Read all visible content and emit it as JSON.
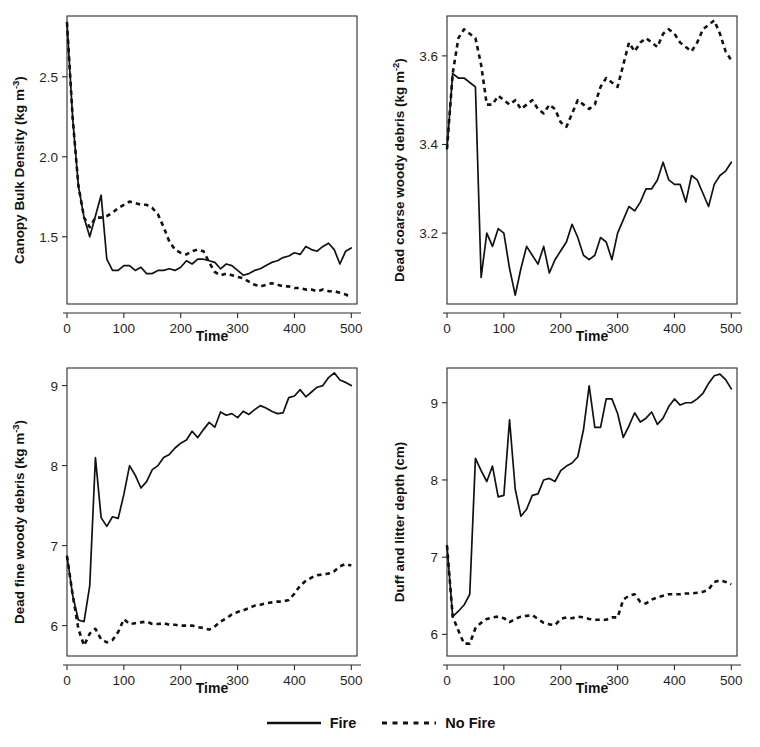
{
  "figure": {
    "layout": "2x2 grid of line charts with shared bottom legend",
    "legend": {
      "position": "bottom-center",
      "entries": [
        {
          "label": "Fire",
          "style": "solid",
          "color": "#111111"
        },
        {
          "label": "No Fire",
          "style": "dashed",
          "color": "#111111"
        }
      ]
    }
  },
  "chart_data": [
    {
      "type": "line",
      "panel": "top-left",
      "title": "",
      "xlabel": "Time",
      "ylabel": "Canopy Bulk Density (kg m-3)",
      "ylabel_base": "Canopy Bulk Density (kg m",
      "ylabel_sup": "-3",
      "ylabel_tail": ")",
      "xlim": [
        0,
        510
      ],
      "ylim": [
        1.08,
        2.88
      ],
      "xticks": [
        0,
        100,
        200,
        300,
        400,
        500
      ],
      "yticks": [
        1.5,
        2.0,
        2.5
      ],
      "ytick_labels": [
        "1.5",
        "2.0",
        "2.5"
      ],
      "grid": false,
      "x": [
        0,
        10,
        20,
        30,
        40,
        50,
        60,
        70,
        80,
        90,
        100,
        110,
        120,
        130,
        140,
        150,
        160,
        170,
        180,
        190,
        200,
        210,
        220,
        230,
        240,
        250,
        260,
        270,
        280,
        290,
        300,
        310,
        320,
        330,
        340,
        350,
        360,
        370,
        380,
        390,
        400,
        410,
        420,
        430,
        440,
        450,
        460,
        470,
        480,
        490,
        500
      ],
      "series": [
        {
          "name": "Fire",
          "style": "solid",
          "values": [
            2.84,
            2.24,
            1.82,
            1.62,
            1.5,
            1.63,
            1.76,
            1.36,
            1.29,
            1.29,
            1.32,
            1.32,
            1.29,
            1.31,
            1.27,
            1.27,
            1.29,
            1.29,
            1.3,
            1.29,
            1.31,
            1.35,
            1.33,
            1.36,
            1.36,
            1.35,
            1.34,
            1.3,
            1.33,
            1.32,
            1.29,
            1.26,
            1.27,
            1.29,
            1.3,
            1.32,
            1.34,
            1.35,
            1.37,
            1.38,
            1.4,
            1.39,
            1.44,
            1.42,
            1.41,
            1.44,
            1.46,
            1.42,
            1.33,
            1.41,
            1.43
          ]
        },
        {
          "name": "No Fire",
          "style": "dashed",
          "values": [
            2.84,
            2.24,
            1.82,
            1.62,
            1.56,
            1.62,
            1.62,
            1.63,
            1.65,
            1.68,
            1.7,
            1.72,
            1.71,
            1.7,
            1.7,
            1.68,
            1.64,
            1.56,
            1.47,
            1.42,
            1.4,
            1.39,
            1.41,
            1.42,
            1.41,
            1.34,
            1.28,
            1.26,
            1.27,
            1.26,
            1.25,
            1.24,
            1.22,
            1.2,
            1.19,
            1.2,
            1.21,
            1.2,
            1.19,
            1.19,
            1.18,
            1.18,
            1.17,
            1.17,
            1.16,
            1.17,
            1.16,
            1.16,
            1.15,
            1.14,
            1.12
          ]
        }
      ]
    },
    {
      "type": "line",
      "panel": "top-right",
      "title": "",
      "xlabel": "Time",
      "ylabel": "Dead coarse woody debris (kg m-2)",
      "ylabel_base": "Dead coarse woody debris (kg m",
      "ylabel_sup": "-2",
      "ylabel_tail": ")",
      "xlim": [
        0,
        510
      ],
      "ylim": [
        3.04,
        3.69
      ],
      "xticks": [
        0,
        100,
        200,
        300,
        400,
        500
      ],
      "yticks": [
        3.2,
        3.4,
        3.6
      ],
      "ytick_labels": [
        "3.2",
        "3.4",
        "3.6"
      ],
      "grid": false,
      "x": [
        0,
        10,
        20,
        30,
        40,
        50,
        60,
        70,
        80,
        90,
        100,
        110,
        120,
        130,
        140,
        150,
        160,
        170,
        180,
        190,
        200,
        210,
        220,
        230,
        240,
        250,
        260,
        270,
        280,
        290,
        300,
        310,
        320,
        330,
        340,
        350,
        360,
        370,
        380,
        390,
        400,
        410,
        420,
        430,
        440,
        450,
        460,
        470,
        480,
        490,
        500
      ],
      "series": [
        {
          "name": "Fire",
          "style": "solid",
          "values": [
            3.39,
            3.56,
            3.55,
            3.55,
            3.54,
            3.53,
            3.1,
            3.2,
            3.17,
            3.21,
            3.2,
            3.12,
            3.06,
            3.12,
            3.17,
            3.15,
            3.13,
            3.17,
            3.11,
            3.14,
            3.16,
            3.18,
            3.22,
            3.19,
            3.15,
            3.14,
            3.15,
            3.19,
            3.18,
            3.14,
            3.2,
            3.23,
            3.26,
            3.25,
            3.27,
            3.3,
            3.3,
            3.32,
            3.36,
            3.32,
            3.31,
            3.31,
            3.27,
            3.33,
            3.32,
            3.29,
            3.26,
            3.31,
            3.33,
            3.34,
            3.36
          ]
        },
        {
          "name": "No Fire",
          "style": "dashed",
          "values": [
            3.39,
            3.56,
            3.64,
            3.66,
            3.65,
            3.64,
            3.58,
            3.49,
            3.49,
            3.51,
            3.5,
            3.49,
            3.5,
            3.48,
            3.49,
            3.5,
            3.48,
            3.47,
            3.49,
            3.48,
            3.45,
            3.44,
            3.47,
            3.5,
            3.49,
            3.48,
            3.49,
            3.53,
            3.55,
            3.54,
            3.53,
            3.58,
            3.63,
            3.61,
            3.63,
            3.64,
            3.63,
            3.62,
            3.65,
            3.66,
            3.65,
            3.63,
            3.62,
            3.61,
            3.63,
            3.66,
            3.67,
            3.68,
            3.65,
            3.61,
            3.59
          ]
        }
      ]
    },
    {
      "type": "line",
      "panel": "bottom-left",
      "title": "",
      "xlabel": "Time",
      "ylabel": "Dead fine woody debris (kg m-3)",
      "ylabel_base": "Dead fine woody debris (kg m",
      "ylabel_sup": "-3",
      "ylabel_tail": ")",
      "xlim": [
        0,
        510
      ],
      "ylim": [
        5.62,
        9.22
      ],
      "xticks": [
        0,
        100,
        200,
        300,
        400,
        500
      ],
      "yticks": [
        6,
        7,
        8,
        9
      ],
      "ytick_labels": [
        "6",
        "7",
        "8",
        "9"
      ],
      "grid": false,
      "x": [
        0,
        10,
        20,
        30,
        40,
        50,
        60,
        70,
        80,
        90,
        100,
        110,
        120,
        130,
        140,
        150,
        160,
        170,
        180,
        190,
        200,
        210,
        220,
        230,
        240,
        250,
        260,
        270,
        280,
        290,
        300,
        310,
        320,
        330,
        340,
        350,
        360,
        370,
        380,
        390,
        400,
        410,
        420,
        430,
        440,
        450,
        460,
        470,
        480,
        490,
        500
      ],
      "series": [
        {
          "name": "Fire",
          "style": "solid",
          "values": [
            6.87,
            6.38,
            6.07,
            6.05,
            6.5,
            8.1,
            7.35,
            7.24,
            7.36,
            7.34,
            7.64,
            8.0,
            7.88,
            7.72,
            7.8,
            7.95,
            8.0,
            8.1,
            8.14,
            8.22,
            8.28,
            8.32,
            8.43,
            8.35,
            8.45,
            8.54,
            8.48,
            8.67,
            8.63,
            8.65,
            8.6,
            8.68,
            8.64,
            8.7,
            8.75,
            8.72,
            8.68,
            8.65,
            8.66,
            8.85,
            8.87,
            8.95,
            8.86,
            8.92,
            8.98,
            9.0,
            9.1,
            9.16,
            9.07,
            9.04,
            9.0
          ]
        },
        {
          "name": "No Fire",
          "style": "dashed",
          "values": [
            6.87,
            6.38,
            5.96,
            5.75,
            5.9,
            5.96,
            5.83,
            5.79,
            5.82,
            5.92,
            6.08,
            6.02,
            6.03,
            6.04,
            6.05,
            6.02,
            6.02,
            6.03,
            6.01,
            6.01,
            6.0,
            6.0,
            6.0,
            5.98,
            5.97,
            5.95,
            5.99,
            6.05,
            6.09,
            6.14,
            6.17,
            6.19,
            6.22,
            6.25,
            6.26,
            6.28,
            6.29,
            6.3,
            6.3,
            6.32,
            6.4,
            6.5,
            6.56,
            6.6,
            6.63,
            6.64,
            6.65,
            6.68,
            6.74,
            6.77,
            6.75
          ]
        }
      ]
    },
    {
      "type": "line",
      "panel": "bottom-right",
      "title": "",
      "xlabel": "Time",
      "ylabel": "Duff and litter depth (cm)",
      "ylabel_base": "Duff and litter depth (cm)",
      "ylabel_sup": "",
      "ylabel_tail": "",
      "xlim": [
        0,
        510
      ],
      "ylim": [
        5.72,
        9.45
      ],
      "xticks": [
        0,
        100,
        200,
        300,
        400,
        500
      ],
      "yticks": [
        6,
        7,
        8,
        9
      ],
      "ytick_labels": [
        "6",
        "7",
        "8",
        "9"
      ],
      "grid": false,
      "x": [
        0,
        10,
        20,
        30,
        40,
        50,
        60,
        70,
        80,
        90,
        100,
        110,
        120,
        130,
        140,
        150,
        160,
        170,
        180,
        190,
        200,
        210,
        220,
        230,
        240,
        250,
        260,
        270,
        280,
        290,
        300,
        310,
        320,
        330,
        340,
        350,
        360,
        370,
        380,
        390,
        400,
        410,
        420,
        430,
        440,
        450,
        460,
        470,
        480,
        490,
        500
      ],
      "series": [
        {
          "name": "Fire",
          "style": "solid",
          "values": [
            7.15,
            6.23,
            6.3,
            6.38,
            6.52,
            8.28,
            8.12,
            7.98,
            8.18,
            7.78,
            7.8,
            8.78,
            7.88,
            7.53,
            7.62,
            7.8,
            7.82,
            8.0,
            8.02,
            7.98,
            8.12,
            8.18,
            8.22,
            8.3,
            8.65,
            9.22,
            8.68,
            8.68,
            9.05,
            9.05,
            8.86,
            8.55,
            8.7,
            8.87,
            8.75,
            8.8,
            8.88,
            8.72,
            8.8,
            8.95,
            9.05,
            8.97,
            9.0,
            9.0,
            9.05,
            9.12,
            9.25,
            9.35,
            9.37,
            9.3,
            9.18
          ]
        },
        {
          "name": "No Fire",
          "style": "dashed",
          "values": [
            7.15,
            6.23,
            6.05,
            5.88,
            5.88,
            6.08,
            6.15,
            6.2,
            6.22,
            6.23,
            6.21,
            6.16,
            6.2,
            6.23,
            6.24,
            6.25,
            6.2,
            6.15,
            6.13,
            6.12,
            6.2,
            6.22,
            6.21,
            6.23,
            6.22,
            6.2,
            6.19,
            6.19,
            6.19,
            6.22,
            6.22,
            6.45,
            6.5,
            6.52,
            6.42,
            6.4,
            6.45,
            6.48,
            6.5,
            6.52,
            6.52,
            6.52,
            6.53,
            6.53,
            6.54,
            6.55,
            6.58,
            6.68,
            6.7,
            6.68,
            6.65
          ]
        }
      ]
    }
  ]
}
